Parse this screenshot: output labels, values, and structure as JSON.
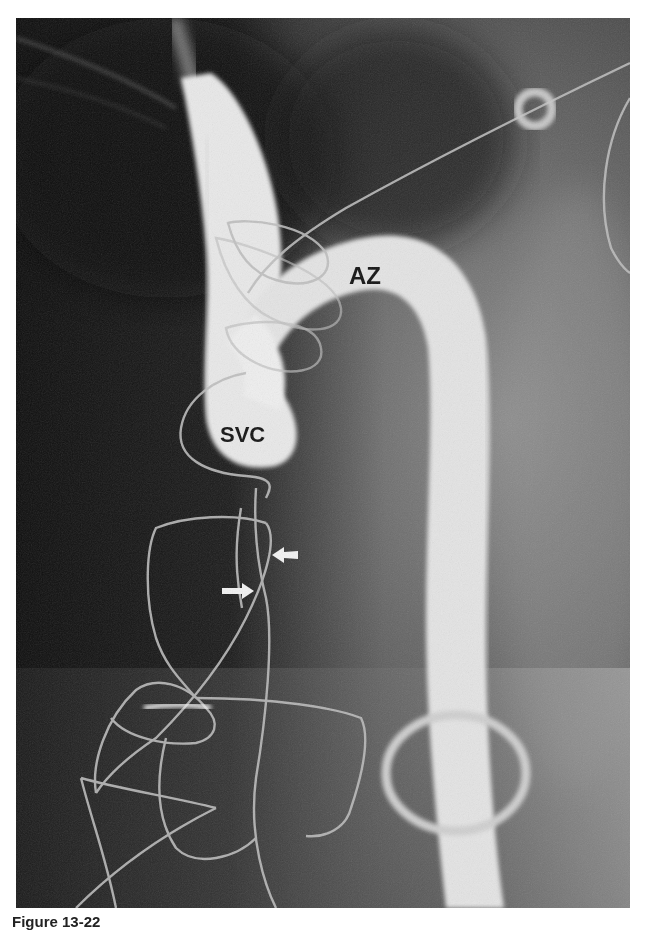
{
  "figure": {
    "type": "grayscale radiograph (contrast venogram)",
    "labels": {
      "azygos": "AZ",
      "svc": "SVC"
    },
    "arrows": [
      {
        "direction": "left",
        "color": "#f2f2f2"
      },
      {
        "direction": "right",
        "color": "#f2f2f2"
      }
    ],
    "colors": {
      "background_dark": "#151515",
      "background_mid": "#5a5a5a",
      "vessel_contrast": "#ececec",
      "wire": "#bdbdbd",
      "label_text": "#111111",
      "page": "#ffffff"
    }
  },
  "caption": {
    "text": "Figure 13-22"
  }
}
